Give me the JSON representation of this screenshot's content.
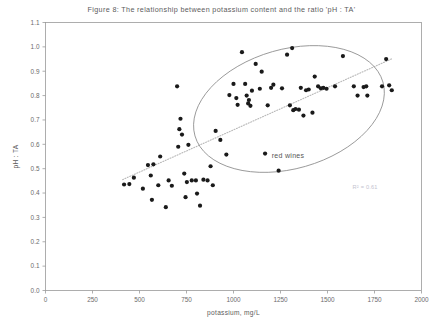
{
  "chart_data": {
    "type": "scatter",
    "title": "Figure 8: The relationship between potassium content and the ratio 'pH : TA'",
    "xlabel": "potassium, mg/L",
    "ylabel": "pH : TA",
    "xlim": [
      0,
      2000
    ],
    "ylim": [
      0.0,
      1.1
    ],
    "xticks": [
      0,
      250,
      500,
      750,
      1000,
      1250,
      1500,
      1750,
      2000
    ],
    "yticks": [
      0.0,
      0.1,
      0.2,
      0.3,
      0.4,
      0.5,
      0.6,
      0.7,
      0.8,
      0.9,
      1.0,
      1.1
    ],
    "xtick_labels": [
      "0",
      "250",
      "500",
      "750",
      "1000",
      "1250",
      "1500",
      "1750",
      "2000"
    ],
    "ytick_labels": [
      "0.0",
      "0.1",
      "0.2",
      "0.3",
      "0.4",
      "0.5",
      "0.6",
      "0.7",
      "0.8",
      "0.9",
      "1.0",
      "1.1"
    ],
    "grid": false,
    "legend": "none",
    "marker_color": "#1a1a1a",
    "marker_size": 2.1,
    "points": [
      [
        418,
        0.435
      ],
      [
        446,
        0.437
      ],
      [
        470,
        0.463
      ],
      [
        518,
        0.418
      ],
      [
        545,
        0.515
      ],
      [
        560,
        0.472
      ],
      [
        566,
        0.372
      ],
      [
        574,
        0.518
      ],
      [
        600,
        0.432
      ],
      [
        610,
        0.55
      ],
      [
        640,
        0.342
      ],
      [
        655,
        0.452
      ],
      [
        672,
        0.43
      ],
      [
        700,
        0.838
      ],
      [
        706,
        0.59
      ],
      [
        712,
        0.662
      ],
      [
        718,
        0.705
      ],
      [
        726,
        0.64
      ],
      [
        738,
        0.48
      ],
      [
        745,
        0.383
      ],
      [
        752,
        0.445
      ],
      [
        760,
        0.598
      ],
      [
        778,
        0.452
      ],
      [
        800,
        0.452
      ],
      [
        806,
        0.398
      ],
      [
        822,
        0.348
      ],
      [
        840,
        0.455
      ],
      [
        862,
        0.452
      ],
      [
        878,
        0.51
      ],
      [
        890,
        0.432
      ],
      [
        905,
        0.655
      ],
      [
        930,
        0.618
      ],
      [
        962,
        0.558
      ],
      [
        978,
        0.802
      ],
      [
        1000,
        0.848
      ],
      [
        1015,
        0.79
      ],
      [
        1022,
        0.762
      ],
      [
        1045,
        0.978
      ],
      [
        1062,
        0.848
      ],
      [
        1070,
        0.8
      ],
      [
        1078,
        0.768
      ],
      [
        1082,
        0.782
      ],
      [
        1090,
        0.758
      ],
      [
        1098,
        0.82
      ],
      [
        1118,
        0.93
      ],
      [
        1140,
        0.828
      ],
      [
        1150,
        0.898
      ],
      [
        1168,
        0.562
      ],
      [
        1182,
        0.76
      ],
      [
        1200,
        0.832
      ],
      [
        1212,
        0.845
      ],
      [
        1240,
        0.492
      ],
      [
        1258,
        0.83
      ],
      [
        1285,
        0.968
      ],
      [
        1300,
        0.76
      ],
      [
        1312,
        0.995
      ],
      [
        1318,
        0.74
      ],
      [
        1330,
        0.745
      ],
      [
        1348,
        0.742
      ],
      [
        1358,
        0.832
      ],
      [
        1372,
        0.718
      ],
      [
        1386,
        0.822
      ],
      [
        1400,
        0.825
      ],
      [
        1420,
        0.73
      ],
      [
        1432,
        0.878
      ],
      [
        1450,
        0.838
      ],
      [
        1465,
        0.83
      ],
      [
        1478,
        0.832
      ],
      [
        1495,
        0.828
      ],
      [
        1540,
        0.838
      ],
      [
        1582,
        0.962
      ],
      [
        1640,
        0.838
      ],
      [
        1660,
        0.8
      ],
      [
        1692,
        0.835
      ],
      [
        1706,
        0.838
      ],
      [
        1712,
        0.8
      ],
      [
        1790,
        0.838
      ],
      [
        1812,
        0.95
      ],
      [
        1828,
        0.842
      ],
      [
        1842,
        0.822
      ]
    ],
    "trendline": {
      "x_start": 410,
      "y_start": 0.455,
      "x_end": 1845,
      "y_end": 0.952,
      "style": "dotted",
      "color": "#b8b8b8"
    },
    "ellipse": {
      "label": "red wines",
      "center_x": 1295,
      "center_y": 0.745,
      "radius_x": 520,
      "radius_y": 0.245,
      "rotation_deg": -16,
      "stroke": "#8c8c8c"
    },
    "annotations": [
      {
        "name": "red-wines-label",
        "text": "red wines",
        "x": 1290,
        "y": 0.545
      },
      {
        "name": "r2-label",
        "text": "R² = 0.61",
        "x": 1700,
        "y": 0.415
      }
    ],
    "axis_color": "#9a9a9a"
  }
}
